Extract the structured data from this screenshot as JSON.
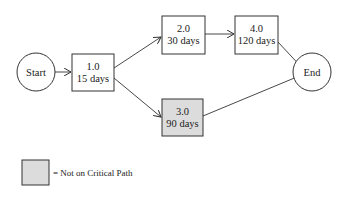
{
  "diagram": {
    "type": "network-schedule",
    "nodes": {
      "start": {
        "label": "Start"
      },
      "task1": {
        "id": "1.0",
        "duration": "15 days",
        "critical": true
      },
      "task2": {
        "id": "2.0",
        "duration": "30 days",
        "critical": true
      },
      "task3": {
        "id": "3.0",
        "duration": "90 days",
        "critical": false
      },
      "task4": {
        "id": "4.0",
        "duration": "120 days",
        "critical": true
      },
      "end": {
        "label": "End"
      }
    },
    "edges": [
      {
        "from": "start",
        "to": "task1"
      },
      {
        "from": "task1",
        "to": "task2"
      },
      {
        "from": "task1",
        "to": "task3"
      },
      {
        "from": "task2",
        "to": "task4"
      },
      {
        "from": "task4",
        "to": "end"
      },
      {
        "from": "task3",
        "to": "end"
      }
    ],
    "colors": {
      "stroke": "#333333",
      "critical_fill": "#ffffff",
      "non_critical_fill": "#dcdcdc"
    },
    "legend": {
      "label": "= Not on Critical Path"
    }
  }
}
